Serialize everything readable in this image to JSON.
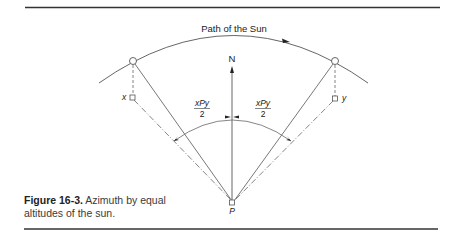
{
  "figure": {
    "path_label": "Path of the Sun",
    "north_label": "N",
    "point_p_label": "P",
    "point_x_label": "x",
    "point_y_label": "y",
    "angle_label_left_num": "xPy",
    "angle_label_left_den": "2",
    "angle_label_right_num": "xPy",
    "angle_label_right_den": "2"
  },
  "caption": {
    "number": "Figure 16-3.",
    "text": "Azimuth by equal altitudes of the sun."
  },
  "colors": {
    "line": "#555555",
    "rule": "#333333"
  }
}
